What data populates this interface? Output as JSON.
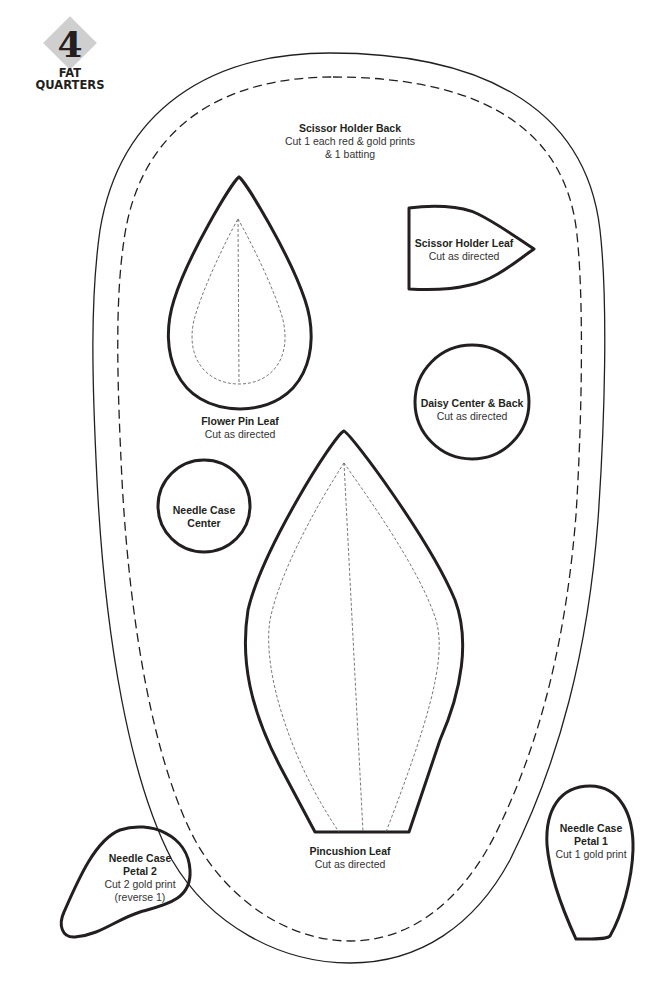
{
  "badge": {
    "number": "4",
    "line1": "FAT",
    "line2": "QUARTERS",
    "diamond_color": "#cfcfcf"
  },
  "pieces": {
    "scissor_holder_back": {
      "title": "Scissor Holder Back",
      "line1": "Cut 1 each red & gold prints",
      "line2": "& 1 batting"
    },
    "scissor_holder_leaf": {
      "title": "Scissor Holder Leaf",
      "line1": "Cut as directed"
    },
    "flower_pin_leaf": {
      "title": "Flower Pin Leaf",
      "line1": "Cut as directed"
    },
    "daisy_center_back": {
      "title": "Daisy Center & Back",
      "line1": "Cut as directed"
    },
    "needle_case_center": {
      "title1": "Needle Case",
      "title2": "Center"
    },
    "pincushion_leaf": {
      "title": "Pincushion Leaf",
      "line1": "Cut as directed"
    },
    "needle_case_petal_2": {
      "title1": "Needle Case",
      "title2": "Petal 2",
      "line1": "Cut 2 gold print",
      "line2": "(reverse 1)"
    },
    "needle_case_petal_1": {
      "title1": "Needle Case",
      "title2": "Petal 1",
      "line1": "Cut 1 gold print"
    }
  },
  "colors": {
    "outline": "#231f20",
    "background": "#ffffff"
  }
}
